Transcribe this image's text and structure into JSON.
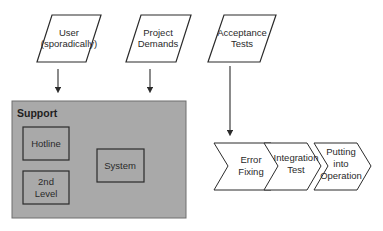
{
  "inputs": [
    {
      "id": "user",
      "lines": [
        "User",
        "(sporadically)"
      ]
    },
    {
      "id": "project-demands",
      "lines": [
        "Project",
        "Demands"
      ]
    },
    {
      "id": "acceptance-tests",
      "lines": [
        "Acceptance",
        "Tests"
      ]
    }
  ],
  "support": {
    "title": "Support",
    "boxes": [
      {
        "id": "hotline",
        "lines": [
          "Hotline"
        ]
      },
      {
        "id": "second-level",
        "lines": [
          "2nd",
          "Level"
        ]
      },
      {
        "id": "system",
        "lines": [
          "System"
        ]
      }
    ]
  },
  "process": [
    {
      "id": "error-fixing",
      "lines": [
        "Error",
        "Fixing"
      ]
    },
    {
      "id": "integration-test",
      "lines": [
        "Integration",
        "Test"
      ]
    },
    {
      "id": "putting-into-operation",
      "lines": [
        "Putting",
        "into",
        "Operation"
      ]
    }
  ],
  "colors": {
    "support_fill": "#a9a9a9",
    "stroke": "#2b2b2b",
    "background": "#ffffff"
  }
}
